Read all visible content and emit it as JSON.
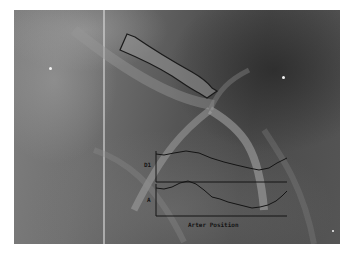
{
  "image": {
    "description": "Grayscale coronary angiogram with an outlined vessel segment and overlaid profile plots",
    "frame_color": "#606060",
    "outline_color": "#1a1a1a"
  },
  "plots": {
    "top_label": "D1",
    "bottom_label": "A",
    "x_axis_label": "Arter Position"
  },
  "markers": [
    {
      "name": "left-dot",
      "x": 50,
      "y": 68
    },
    {
      "name": "right-dot",
      "x": 283,
      "y": 77
    },
    {
      "name": "bottom-right-dot",
      "x": 333,
      "y": 231
    }
  ]
}
